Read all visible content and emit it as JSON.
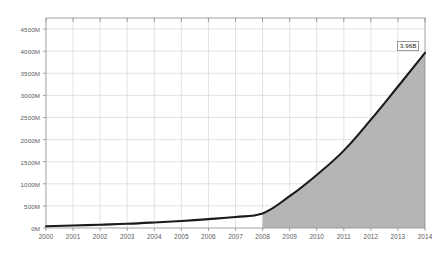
{
  "chart_data": {
    "type": "area",
    "title": "",
    "subtitle": "",
    "xlabel": "",
    "ylabel": "",
    "categories": [
      "2000",
      "2001",
      "2002",
      "2003",
      "2004",
      "2005",
      "2006",
      "2007",
      "2008",
      "2009",
      "2010",
      "2011",
      "2012",
      "2013",
      "2014"
    ],
    "series": [
      {
        "name": "",
        "values": [
          40,
          55,
          75,
          95,
          125,
          160,
          200,
          250,
          330,
          720,
          1200,
          1750,
          2450,
          3200,
          3960
        ]
      }
    ],
    "ylim": [
      0,
      4750
    ],
    "xlim": [
      "2000",
      "2014"
    ],
    "ytick_labels": [
      "0M",
      "500M",
      "1000M",
      "1500M",
      "2000M",
      "2500M",
      "3000M",
      "3500M",
      "4000M",
      "4500M"
    ],
    "ytick_values": [
      0,
      500,
      1000,
      1500,
      2000,
      2500,
      3000,
      3500,
      4000,
      4500
    ],
    "xtick_labels": [
      "2000",
      "2001",
      "2002",
      "2003",
      "2004",
      "2005",
      "2006",
      "2007",
      "2008",
      "2009",
      "2010",
      "2011",
      "2012",
      "2013",
      "2014"
    ],
    "grid": true,
    "legend": "none",
    "annotations": [
      {
        "label": "3.96B",
        "at_category": "2014",
        "at_value": 3960
      }
    ],
    "fill_start_category": "2008",
    "colors": {
      "line": "#1a1a1a",
      "fill": "#b5b5b5",
      "grid": "#d5d5d5",
      "axis": "#8c8c8c",
      "tick_text": "#595959",
      "background": "#ffffff"
    }
  }
}
